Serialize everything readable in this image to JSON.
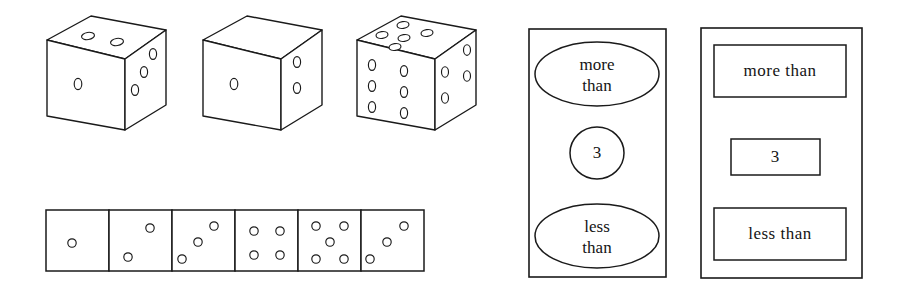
{
  "figure": {
    "background_color": "#ffffff",
    "ink_color": "#1a1a1a",
    "width": 904,
    "height": 300
  },
  "dice_row": {
    "name": "three-dimensional-dice-row",
    "count": 3,
    "dice": [
      {
        "index": 1,
        "top_face_pips": 2,
        "front_face_pips": 1,
        "right_face_pips": 3,
        "top_label": "2",
        "front_label": "1",
        "right_label": "3"
      },
      {
        "index": 2,
        "top_face_pips": 0,
        "front_face_pips": 1,
        "right_face_pips": 2,
        "top_label": "0",
        "front_label": "1",
        "right_label": "2"
      },
      {
        "index": 3,
        "top_face_pips": 5,
        "front_face_pips": 6,
        "right_face_pips": 4,
        "top_label": "5",
        "front_label": "6",
        "right_label": "4"
      }
    ]
  },
  "flat_faces_strip": {
    "name": "flat-die-faces-strip",
    "count": 6,
    "faces": [
      {
        "index": 1,
        "pips": 1,
        "label": "1"
      },
      {
        "index": 2,
        "pips": 2,
        "label": "2"
      },
      {
        "index": 3,
        "pips": 3,
        "label": "3"
      },
      {
        "index": 4,
        "pips": 4,
        "label": "4"
      },
      {
        "index": 5,
        "pips": 5,
        "label": "5"
      },
      {
        "index": 6,
        "pips": 3,
        "label": "3"
      }
    ]
  },
  "oval_card": {
    "name": "comparison-card-ovals",
    "shape": "rectangle-panel",
    "items": [
      {
        "shape": "ellipse",
        "text_line1": "more",
        "text_line2": "than",
        "text": "more than"
      },
      {
        "shape": "circle",
        "text_line1": "3",
        "text_line2": "",
        "text": "3"
      },
      {
        "shape": "ellipse",
        "text_line1": "less",
        "text_line2": "than",
        "text": "less than"
      }
    ]
  },
  "rect_card": {
    "name": "comparison-card-rectangles",
    "shape": "rectangle-panel",
    "items": [
      {
        "shape": "rectangle",
        "text": "more  than"
      },
      {
        "shape": "rectangle",
        "text": "3"
      },
      {
        "shape": "rectangle",
        "text": "less  than"
      }
    ]
  }
}
